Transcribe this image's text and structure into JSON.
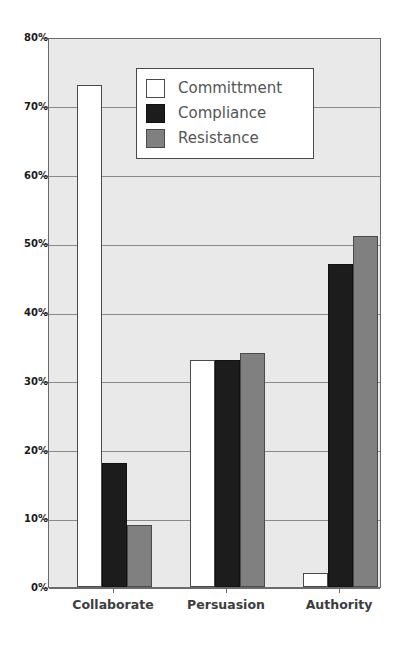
{
  "chart_data": {
    "type": "bar",
    "title": "",
    "xlabel": "",
    "ylabel": "",
    "categories": [
      "Collaborate",
      "Persuasion",
      "Authority"
    ],
    "series": [
      {
        "name": "Committment",
        "color": "#ffffff",
        "values": [
          73,
          33,
          2
        ]
      },
      {
        "name": "Compliance",
        "color": "#1c1c1c",
        "values": [
          18,
          33,
          47
        ]
      },
      {
        "name": "Resistance",
        "color": "#808080",
        "values": [
          9,
          34,
          51
        ]
      }
    ],
    "ylim": [
      0,
      80
    ],
    "ytick_step": 10,
    "ytick_labels": [
      "0%",
      "10%",
      "20%",
      "30%",
      "40%",
      "50%",
      "60%",
      "70%",
      "80%"
    ],
    "ytick_values": [
      0,
      10,
      20,
      30,
      40,
      50,
      60,
      70,
      80
    ],
    "value_suffix": "%",
    "grid": true,
    "grid_axis": "y",
    "legend_position": "upper-center",
    "plot_background": "#e9e9e9",
    "grid_color": "#8a8a8a",
    "axis_color": "#6b6b6b"
  },
  "legend": {
    "items": [
      {
        "label": "Committment",
        "swatch": "legend-swatch-committment"
      },
      {
        "label": "Compliance",
        "swatch": "legend-swatch-compliance"
      },
      {
        "label": "Resistance",
        "swatch": "legend-swatch-resistance"
      }
    ]
  }
}
